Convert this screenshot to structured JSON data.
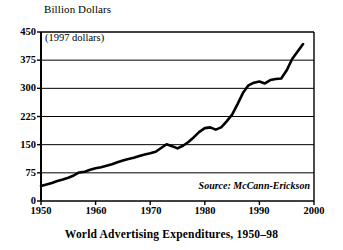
{
  "figure": {
    "axis_title": "Billion Dollars",
    "units_note": "(1997 dollars)",
    "source_note": "Source: McCann-Erickson",
    "caption": "World Advertising Expenditures, 1950–98",
    "line_color": "#000000",
    "grid_color": "#000000",
    "background_color": "#ffffff"
  },
  "chart_data": {
    "type": "line",
    "title": "World Advertising Expenditures, 1950–98",
    "subtitle": "(1997 dollars)",
    "xlabel": "",
    "ylabel": "Billion Dollars",
    "source": "Source: McCann-Erickson",
    "xlim": [
      1950,
      2000
    ],
    "ylim": [
      0,
      450
    ],
    "xticks": [
      1950,
      1960,
      1970,
      1980,
      1990,
      2000
    ],
    "xtick_labels": [
      "1950",
      "1960",
      "1970",
      "1980",
      "1990",
      "2000"
    ],
    "yticks": [
      0,
      75,
      150,
      225,
      300,
      375,
      450
    ],
    "ytick_labels": [
      "0",
      "75",
      "150",
      "225",
      "300",
      "375",
      "450"
    ],
    "grid": "horizontal",
    "legend": "none",
    "series": [
      {
        "name": "World Advertising Expenditures",
        "x": [
          1950,
          1951,
          1952,
          1953,
          1954,
          1955,
          1956,
          1957,
          1958,
          1959,
          1960,
          1961,
          1962,
          1963,
          1964,
          1965,
          1966,
          1967,
          1968,
          1969,
          1970,
          1971,
          1972,
          1973,
          1974,
          1975,
          1976,
          1977,
          1978,
          1979,
          1980,
          1981,
          1982,
          1983,
          1984,
          1985,
          1986,
          1987,
          1988,
          1989,
          1990,
          1991,
          1992,
          1993,
          1994,
          1995,
          1996,
          1997,
          1998
        ],
        "values": [
          40,
          44,
          48,
          53,
          57,
          62,
          68,
          76,
          78,
          83,
          87,
          90,
          94,
          98,
          103,
          108,
          112,
          115,
          120,
          124,
          127,
          131,
          141,
          151,
          146,
          140,
          147,
          157,
          170,
          184,
          194,
          196,
          190,
          196,
          212,
          230,
          258,
          288,
          308,
          315,
          318,
          313,
          322,
          325,
          326,
          348,
          378,
          398,
          418
        ]
      }
    ]
  },
  "ytick_positions_px": [
    201,
    173,
    145,
    117,
    88,
    60,
    32
  ],
  "xtick_positions_px": [
    41,
    96,
    151,
    205,
    259,
    314
  ]
}
